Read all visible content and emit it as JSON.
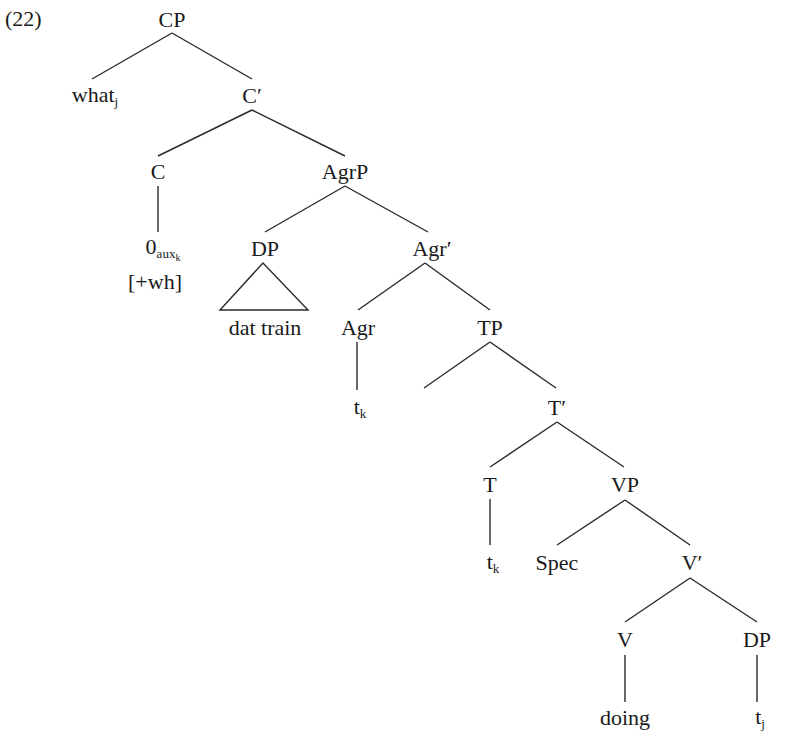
{
  "example_number": "(22)",
  "tree": {
    "nodes": [
      {
        "id": "cp",
        "label": "CP",
        "x": 172,
        "y": 20
      },
      {
        "id": "what",
        "label": "what",
        "sub": "j",
        "x": 95,
        "y": 96
      },
      {
        "id": "cbar",
        "label": "C′",
        "x": 252,
        "y": 96
      },
      {
        "id": "c",
        "label": "C",
        "x": 158,
        "y": 172
      },
      {
        "id": "agrp",
        "label": "AgrP",
        "x": 345,
        "y": 172
      },
      {
        "id": "null-aux",
        "label": "0",
        "sub": "aux",
        "subsub": "k",
        "x": 163,
        "y": 249
      },
      {
        "id": "wh-feature",
        "label": "[+wh]",
        "x": 155,
        "y": 282
      },
      {
        "id": "dp1",
        "label": "DP",
        "x": 265,
        "y": 249
      },
      {
        "id": "agrbar",
        "label": "Agr′",
        "x": 432,
        "y": 249
      },
      {
        "id": "dat-train",
        "label": "dat train",
        "x": 265,
        "y": 328
      },
      {
        "id": "agr",
        "label": "Agr",
        "x": 358,
        "y": 328
      },
      {
        "id": "tp",
        "label": "TP",
        "x": 490,
        "y": 328
      },
      {
        "id": "agr-trace",
        "label": "t",
        "sub": "k",
        "x": 360,
        "y": 408
      },
      {
        "id": "tbar",
        "label": "T′",
        "x": 557,
        "y": 408
      },
      {
        "id": "t",
        "label": "T",
        "x": 490,
        "y": 485
      },
      {
        "id": "vp",
        "label": "VP",
        "x": 625,
        "y": 485
      },
      {
        "id": "t-trace",
        "label": "t",
        "sub": "k",
        "x": 493,
        "y": 563
      },
      {
        "id": "spec",
        "label": "Spec",
        "x": 557,
        "y": 563
      },
      {
        "id": "vbar",
        "label": "V′",
        "x": 692,
        "y": 563
      },
      {
        "id": "v",
        "label": "V",
        "x": 625,
        "y": 640
      },
      {
        "id": "dp2",
        "label": "DP",
        "x": 757,
        "y": 640
      },
      {
        "id": "doing",
        "label": "doing",
        "x": 625,
        "y": 718
      },
      {
        "id": "dp-trace",
        "label": "t",
        "sub": "j",
        "x": 760,
        "y": 718
      }
    ],
    "edges": [
      {
        "from": "cp",
        "to": "what",
        "x1": 172,
        "y1": 33,
        "x2": 92,
        "y2": 79
      },
      {
        "from": "cp",
        "to": "cbar",
        "x1": 172,
        "y1": 33,
        "x2": 252,
        "y2": 79
      },
      {
        "from": "cbar",
        "to": "c",
        "x1": 252,
        "y1": 110,
        "x2": 158,
        "y2": 156
      },
      {
        "from": "cbar",
        "to": "agrp",
        "x1": 252,
        "y1": 110,
        "x2": 345,
        "y2": 156
      },
      {
        "from": "c",
        "to": "null-aux",
        "x1": 158,
        "y1": 186,
        "x2": 158,
        "y2": 232
      },
      {
        "from": "agrp",
        "to": "dp1",
        "x1": 345,
        "y1": 186,
        "x2": 265,
        "y2": 232
      },
      {
        "from": "agrp",
        "to": "agrbar",
        "x1": 345,
        "y1": 186,
        "x2": 428,
        "y2": 232
      },
      {
        "from": "agrbar",
        "to": "agr",
        "x1": 425,
        "y1": 263,
        "x2": 358,
        "y2": 310
      },
      {
        "from": "agrbar",
        "to": "tp",
        "x1": 425,
        "y1": 263,
        "x2": 490,
        "y2": 310
      },
      {
        "from": "agr",
        "to": "agr-trace",
        "x1": 357,
        "y1": 342,
        "x2": 357,
        "y2": 390
      },
      {
        "from": "tp",
        "to": "spec-empty",
        "x1": 490,
        "y1": 342,
        "x2": 424,
        "y2": 388
      },
      {
        "from": "tp",
        "to": "tbar",
        "x1": 490,
        "y1": 342,
        "x2": 556,
        "y2": 388
      },
      {
        "from": "tbar",
        "to": "t",
        "x1": 557,
        "y1": 422,
        "x2": 490,
        "y2": 467
      },
      {
        "from": "tbar",
        "to": "vp",
        "x1": 557,
        "y1": 422,
        "x2": 624,
        "y2": 467
      },
      {
        "from": "t",
        "to": "t-trace",
        "x1": 490,
        "y1": 499,
        "x2": 490,
        "y2": 545
      },
      {
        "from": "vp",
        "to": "spec",
        "x1": 625,
        "y1": 500,
        "x2": 557,
        "y2": 545
      },
      {
        "from": "vp",
        "to": "vbar",
        "x1": 625,
        "y1": 500,
        "x2": 690,
        "y2": 545
      },
      {
        "from": "vbar",
        "to": "v",
        "x1": 690,
        "y1": 578,
        "x2": 625,
        "y2": 622
      },
      {
        "from": "vbar",
        "to": "dp2",
        "x1": 690,
        "y1": 578,
        "x2": 757,
        "y2": 622
      },
      {
        "from": "v",
        "to": "doing",
        "x1": 625,
        "y1": 655,
        "x2": 625,
        "y2": 702
      },
      {
        "from": "dp2",
        "to": "dp-trace",
        "x1": 757,
        "y1": 655,
        "x2": 757,
        "y2": 702
      }
    ],
    "triangle": {
      "node": "dp1",
      "apex": [
        263,
        263
      ],
      "left": [
        220,
        310
      ],
      "right": [
        308,
        310
      ]
    }
  },
  "colors": {
    "line": "#2a2a2a",
    "text": "#1a1a1a",
    "background": "#ffffff"
  }
}
